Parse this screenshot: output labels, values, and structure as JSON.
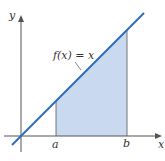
{
  "diagram": {
    "function_label": "f(x) = x",
    "axis_x_label": "x",
    "axis_y_label": "y",
    "tick_a": "a",
    "tick_b": "b",
    "colors": {
      "line": "#2f6db5",
      "fill": "#c9daf0",
      "axis": "#555555"
    }
  }
}
